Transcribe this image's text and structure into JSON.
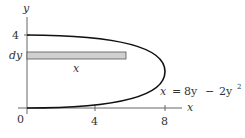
{
  "diagram": {
    "equation_lhs": "x",
    "equation_eq": "=",
    "equation_term1": "8y",
    "equation_minus": "−",
    "equation_term2": "2y",
    "equation_exp": "2",
    "axis_x_label": "x",
    "axis_y_label": "y",
    "origin_label": "0",
    "x_ticks": [
      "4",
      "8"
    ],
    "y_ticks": [
      "4"
    ],
    "strip_label": "dy",
    "strip_length_label": "x",
    "colors": {
      "curve": "#111111",
      "axis": "#555555",
      "strip_fill": "#d0d0d0",
      "strip_stroke": "#444444"
    }
  }
}
